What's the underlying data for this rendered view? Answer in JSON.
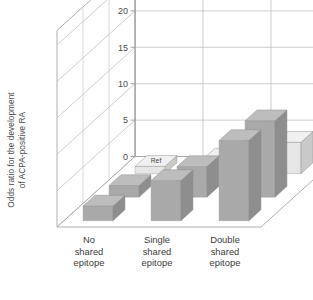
{
  "chart_data": {
    "type": "bar",
    "title": "",
    "subtitle": "",
    "xlabel": "",
    "ylabel": "Odds ratio for the development of ACPA-positive RA",
    "ylabel_line1": "Odds ratio for the development",
    "ylabel_line2": "of ACPA-positive RA",
    "ylim": [
      0,
      27
    ],
    "yticks": [
      0,
      5,
      10,
      15,
      20,
      25
    ],
    "ytick_labels": [
      "0",
      "5",
      "10",
      "15",
      "20",
      "25"
    ],
    "grid": true,
    "grid_on_back_walls": true,
    "legend": "none",
    "projection": "3d",
    "categories": [
      "No shared epitope",
      "Single shared epitope",
      "Double shared epitope"
    ],
    "category_lines": [
      [
        "No",
        "shared",
        "epitope"
      ],
      [
        "Single",
        "shared",
        "epitope"
      ],
      [
        "Double",
        "shared",
        "epitope"
      ]
    ],
    "depth_series": [
      "back",
      "middle",
      "front"
    ],
    "series": [
      {
        "name": "back",
        "values": [
          2.0,
          5.5,
          11.0
        ]
      },
      {
        "name": "middle",
        "values": [
          1.6,
          4.2,
          10.5
        ]
      },
      {
        "name": "front",
        "values": [
          1.0,
          2.0,
          4.3
        ]
      }
    ],
    "annotations": [
      {
        "text": "Ref",
        "category": "No shared epitope",
        "series": "front"
      }
    ],
    "colors": {
      "bar_light_front": "#e6e6e6",
      "bar_light_top": "#f0f0f0",
      "bar_light_side": "#c9c9c9",
      "bar_dark_front": "#a9a9a9",
      "bar_dark_top": "#bdbdbd",
      "bar_dark_side": "#8e8e8e",
      "gridline": "#b8b8b8",
      "axis": "#9a9a9a",
      "text": "#4a4a4a",
      "background": "#ffffff"
    },
    "bar_shading": [
      {
        "series": "back",
        "style": "dark"
      },
      {
        "series": "middle",
        "style": "dark"
      },
      {
        "series": "front",
        "style": "light"
      }
    ]
  }
}
